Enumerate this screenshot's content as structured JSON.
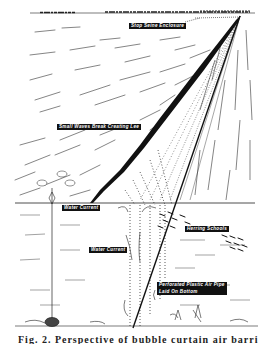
{
  "figure": {
    "type": "illustration",
    "labels": {
      "stop_seine": "Stop Seine Enclosure",
      "small_waves": "Small Waves Break Creating Lee",
      "water_current_1": "Water Current",
      "water_current_2": "Water Current",
      "herring": "Herring Schools",
      "pipe_line1": "Perforated Plastic Air Pipe",
      "pipe_line2": "Laid On Bottom"
    },
    "caption": "Fig. 2. Perspective of bubble curtain air barrier"
  },
  "colors": {
    "ink": "#111111",
    "paper": "#ffffff",
    "label_bg": "#111111",
    "label_text": "#ffffff"
  }
}
